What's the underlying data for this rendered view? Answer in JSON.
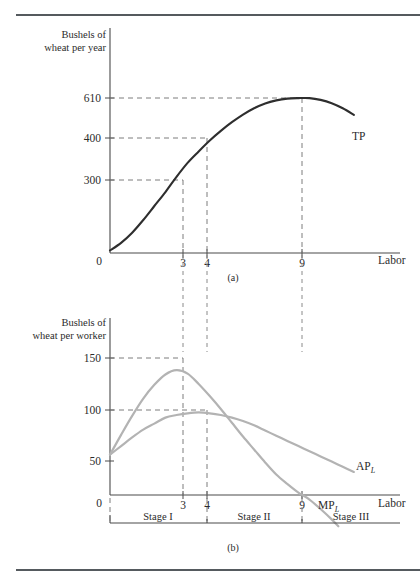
{
  "figure": {
    "panel_a_caption": "(a)",
    "panel_b_caption": "(b)"
  },
  "panel_a": {
    "y_axis_title_line1": "Bushels of",
    "y_axis_title_line2": "wheat per year",
    "x_axis_title": "Labor",
    "origin_label": "0",
    "y_ticks": [
      "610",
      "400",
      "300"
    ],
    "x_ticks": [
      "3",
      "4",
      "9"
    ],
    "curve_label": "TP"
  },
  "panel_b": {
    "y_axis_title_line1": "Bushels of",
    "y_axis_title_line2": "wheat per worker",
    "x_axis_title": "Labor",
    "origin_label": "0",
    "y_ticks": [
      "150",
      "100",
      "50"
    ],
    "x_ticks": [
      "3",
      "4",
      "9"
    ],
    "ap_label": "AP",
    "ap_sub": "L",
    "mp_label": "MP",
    "mp_sub": "L",
    "stages": [
      "Stage I",
      "Stage II",
      "Stage III"
    ]
  },
  "chart_data": [
    {
      "type": "line",
      "id": "panel-a-total-product",
      "title": "(a)",
      "xlabel": "Labor",
      "ylabel": "Bushels of wheat per year",
      "xlim": [
        0,
        12
      ],
      "ylim": [
        0,
        760
      ],
      "grid": false,
      "legend": "inline-right",
      "y_tick_values": [
        300,
        400,
        610
      ],
      "x_tick_values": [
        3,
        4,
        9
      ],
      "series": [
        {
          "name": "TP",
          "color": "#2e2e2e",
          "points": [
            [
              0,
              10
            ],
            [
              0.5,
              40
            ],
            [
              1,
              80
            ],
            [
              1.5,
              130
            ],
            [
              2,
              185
            ],
            [
              2.5,
              240
            ],
            [
              3,
              300
            ],
            [
              3.5,
              355
            ],
            [
              4,
              400
            ],
            [
              4.5,
              443
            ],
            [
              5,
              481
            ],
            [
              5.5,
              515
            ],
            [
              6,
              545
            ],
            [
              6.5,
              570
            ],
            [
              7,
              589
            ],
            [
              7.5,
              601
            ],
            [
              8,
              608
            ],
            [
              8.5,
              610
            ],
            [
              9,
              610
            ],
            [
              9.5,
              603
            ],
            [
              10,
              590
            ],
            [
              10.5,
              570
            ],
            [
              11,
              544
            ]
          ]
        }
      ],
      "annotations": [
        {
          "text": "inflection point",
          "x": 3,
          "y": 300
        },
        {
          "text": "TP = 400 where AP is maximum",
          "x": 4,
          "y": 400
        },
        {
          "text": "TP maximum",
          "x": 9,
          "y": 610
        }
      ]
    },
    {
      "type": "line",
      "id": "panel-b-average-and-marginal-product",
      "title": "(b)",
      "xlabel": "Labor",
      "ylabel": "Bushels of wheat per worker",
      "xlim": [
        0,
        12
      ],
      "ylim": [
        -40,
        185
      ],
      "grid": false,
      "legend": "inline-right",
      "y_tick_values": [
        50,
        100,
        150
      ],
      "x_tick_values": [
        3,
        4,
        9
      ],
      "series": [
        {
          "name": "MP",
          "color": "#b3b3b3",
          "points": [
            [
              0,
              52
            ],
            [
              0.5,
              75
            ],
            [
              1,
              97
            ],
            [
              1.5,
              117
            ],
            [
              2,
              133
            ],
            [
              2.5,
              145
            ],
            [
              3,
              150
            ],
            [
              3.5,
              146
            ],
            [
              4,
              134
            ],
            [
              4.5,
              120
            ],
            [
              5,
              105
            ],
            [
              5.5,
              89
            ],
            [
              6,
              73
            ],
            [
              6.5,
              58
            ],
            [
              7,
              43
            ],
            [
              7.5,
              29
            ],
            [
              8,
              18
            ],
            [
              8.5,
              8
            ],
            [
              9,
              0
            ],
            [
              9.5,
              -11
            ],
            [
              10,
              -23
            ],
            [
              10.3,
              -31
            ]
          ]
        },
        {
          "name": "AP",
          "color": "#b3b3b3",
          "points": [
            [
              0,
              52
            ],
            [
              0.5,
              62
            ],
            [
              1,
              72
            ],
            [
              1.5,
              81
            ],
            [
              2,
              88
            ],
            [
              2.5,
              95
            ],
            [
              3,
              98
            ],
            [
              3.5,
              100
            ],
            [
              4,
              101
            ],
            [
              4.5,
              100
            ],
            [
              5,
              98
            ],
            [
              5.5,
              95
            ],
            [
              6,
              91
            ],
            [
              6.5,
              86
            ],
            [
              7,
              80
            ],
            [
              7.5,
              74
            ],
            [
              8,
              68
            ],
            [
              8.5,
              62
            ],
            [
              9,
              56
            ],
            [
              9.5,
              50
            ],
            [
              10,
              44
            ],
            [
              10.5,
              38
            ],
            [
              11,
              32
            ]
          ]
        }
      ],
      "annotations": [
        {
          "text": "MP maximum at L = 3",
          "x": 3,
          "y": 150
        },
        {
          "text": "AP maximum equals MP at L = 4",
          "x": 4,
          "y": 100
        },
        {
          "text": "MP equals zero at L = 9",
          "x": 9,
          "y": 0
        }
      ],
      "stage_ranges": [
        {
          "label": "Stage I",
          "from": 0,
          "to": 4
        },
        {
          "label": "Stage II",
          "from": 4,
          "to": 9
        },
        {
          "label": "Stage III",
          "from": 9,
          "to": 12
        }
      ]
    }
  ]
}
